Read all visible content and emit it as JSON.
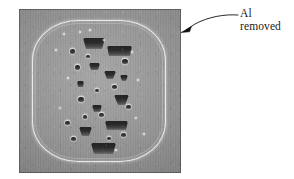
{
  "figure": {
    "type": "sem-micrograph",
    "caption_present": false,
    "background_color": "#ffffff",
    "micrograph": {
      "base_gray": "#8d8d8d",
      "bright_band_color": "#ffffff",
      "cavity_color": "#2e2e2e",
      "description": "Cross-sectional electron micrograph of an etched rounded-rectangular specimen with a bright etched boundary band and a central vertical column of dark trapezoidal voids and small pits"
    }
  },
  "annotation": {
    "label": {
      "line1": "Al",
      "line2": "removed"
    },
    "leader": {
      "kind": "curved-arrow",
      "arrowhead": "solid-triangle",
      "points_to": "specimen-right-edge",
      "color": "#111111"
    }
  },
  "cavities": {
    "large": [
      {
        "x": 64,
        "y": 29,
        "w": 22,
        "h": 11,
        "taper": 3
      },
      {
        "x": 88,
        "y": 37,
        "w": 25,
        "h": 10,
        "taper": 2
      },
      {
        "x": 70,
        "y": 54,
        "w": 11,
        "h": 7,
        "taper": 2
      },
      {
        "x": 85,
        "y": 62,
        "w": 12,
        "h": 8,
        "taper": 3
      },
      {
        "x": 95,
        "y": 86,
        "w": 15,
        "h": 10,
        "taper": 4
      },
      {
        "x": 73,
        "y": 96,
        "w": 10,
        "h": 7,
        "taper": 2
      },
      {
        "x": 86,
        "y": 112,
        "w": 23,
        "h": 9,
        "taper": 2
      },
      {
        "x": 60,
        "y": 118,
        "w": 13,
        "h": 9,
        "taper": 3
      },
      {
        "x": 72,
        "y": 134,
        "w": 25,
        "h": 11,
        "taper": 3
      },
      {
        "x": 101,
        "y": 66,
        "w": 8,
        "h": 6,
        "taper": 2
      },
      {
        "x": 58,
        "y": 72,
        "w": 7,
        "h": 6,
        "taper": 1
      }
    ],
    "pits": [
      {
        "x": 51,
        "y": 40,
        "w": 5,
        "h": 5
      },
      {
        "x": 56,
        "y": 56,
        "w": 5,
        "h": 5
      },
      {
        "x": 103,
        "y": 50,
        "w": 6,
        "h": 5
      },
      {
        "x": 93,
        "y": 76,
        "w": 5,
        "h": 4
      },
      {
        "x": 59,
        "y": 88,
        "w": 6,
        "h": 5
      },
      {
        "x": 107,
        "y": 96,
        "w": 5,
        "h": 4
      },
      {
        "x": 80,
        "y": 104,
        "w": 5,
        "h": 4
      },
      {
        "x": 46,
        "y": 112,
        "w": 5,
        "h": 4
      },
      {
        "x": 64,
        "y": 106,
        "w": 4,
        "h": 4
      },
      {
        "x": 102,
        "y": 124,
        "w": 5,
        "h": 4
      },
      {
        "x": 52,
        "y": 128,
        "w": 5,
        "h": 4
      },
      {
        "x": 88,
        "y": 128,
        "w": 4,
        "h": 3
      },
      {
        "x": 67,
        "y": 46,
        "w": 4,
        "h": 3
      },
      {
        "x": 76,
        "y": 80,
        "w": 4,
        "h": 3
      }
    ],
    "specks": [
      {
        "x": 44,
        "y": 24,
        "w": 2,
        "h": 2
      },
      {
        "x": 60,
        "y": 22,
        "w": 2,
        "h": 2
      },
      {
        "x": 84,
        "y": 30,
        "w": 2,
        "h": 2
      },
      {
        "x": 48,
        "y": 68,
        "w": 2,
        "h": 2
      },
      {
        "x": 112,
        "y": 42,
        "w": 2,
        "h": 2
      },
      {
        "x": 118,
        "y": 70,
        "w": 2,
        "h": 2
      },
      {
        "x": 40,
        "y": 98,
        "w": 2,
        "h": 2
      },
      {
        "x": 116,
        "y": 108,
        "w": 2,
        "h": 2
      },
      {
        "x": 70,
        "y": 20,
        "w": 2,
        "h": 2
      },
      {
        "x": 96,
        "y": 140,
        "w": 2,
        "h": 2
      },
      {
        "x": 124,
        "y": 124,
        "w": 2,
        "h": 2
      },
      {
        "x": 36,
        "y": 40,
        "w": 2,
        "h": 2
      }
    ]
  }
}
